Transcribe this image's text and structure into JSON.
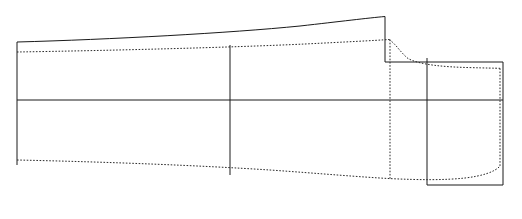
{
  "diagram": {
    "canvas": {
      "width": 522,
      "height": 219
    },
    "background_color": "#ffffff",
    "solid_color": "#1a1a1a",
    "dotted_color": "#2b2b2b",
    "stroke_width": 1,
    "dash_pattern": "1.6 1.6",
    "elements": {
      "outer_top_solid_curve": {
        "kind": "curve",
        "style": "solid",
        "description": "upper outer sheer line rising gently left to right to the peak",
        "path": "M 17 42 C 110 39.5 230 33 300 26 C 340 21.5 368 18 385 16.5"
      },
      "peak_vertical_solid": {
        "kind": "line",
        "style": "solid",
        "description": "vertical drop at the peak station",
        "path": "M 385 16.5 L 385 62"
      },
      "upper_inner_dotted_curve": {
        "kind": "curve",
        "style": "dotted",
        "description": "upper inner line parallel below the solid sheer, ending at peak station",
        "path": "M 17 52 C 110 50.5 230 47.5 300 44.5 C 340 42.5 372 40 390 58"
      },
      "upper_dotted_main": {
        "kind": "curve",
        "style": "dotted",
        "description": "upper dotted contour from left to the peak shoulder",
        "path": "M 17 52 C 110 50.5 230 47.5 305 44 C 345 42 375 40.5 389 39.5"
      },
      "dotted_shoulder_drop": {
        "kind": "curve",
        "style": "dotted",
        "description": "steep dotted fall just after the peak, flattening to the right",
        "path": "M 389 39.5 C 396 44 400 52 408 58.5 C 420 65 445 67 470 67.6 C 485 68 495 68.2 500 68.3"
      },
      "rect_top_solid": {
        "kind": "line",
        "style": "solid",
        "description": "top edge of right-hand block running from peak station to right edge",
        "path": "M 385 62 L 503 62"
      },
      "left_vertical_solid": {
        "kind": "line",
        "style": "solid",
        "description": "left end station vertical",
        "path": "M 17 42 L 17 165"
      },
      "mid_vertical_solid": {
        "kind": "line",
        "style": "solid",
        "description": "middle station vertical divider",
        "path": "M 230 45 L 230 175"
      },
      "right_block_vertical_solid": {
        "kind": "line",
        "style": "solid",
        "description": "interior vertical of the right-hand block",
        "path": "M 427 58 L 427 185"
      },
      "right_vertical_solid": {
        "kind": "line",
        "style": "solid",
        "description": "right end station vertical",
        "path": "M 503 62 L 503 185"
      },
      "center_horizontal_solid": {
        "kind": "line",
        "style": "solid",
        "description": "central waterline running the full width",
        "path": "M 17 100 L 503 100"
      },
      "rect_bottom_solid": {
        "kind": "line",
        "style": "solid",
        "description": "bottom edge of the right-hand block",
        "path": "M 427 185 L 503 185"
      },
      "lower_dotted_curve": {
        "kind": "curve",
        "style": "dotted",
        "description": "lower hull contour sloping down then sweeping back up at the right",
        "path": "M 17 160 C 110 162 200 165.5 270 170 C 320 173.5 360 177 390 178.6 C 420 180 445 180.2 465 178 C 482 176 495 172 500 166"
      },
      "peak_dotted_vertical": {
        "kind": "line",
        "style": "dotted",
        "description": "dotted vertical station line below the peak",
        "path": "M 390 39.5 L 390 178.6"
      },
      "right_dotted_vertical": {
        "kind": "line",
        "style": "dotted",
        "description": "dotted vertical station line at the right end",
        "path": "M 500 68.3 L 500 166"
      }
    }
  }
}
